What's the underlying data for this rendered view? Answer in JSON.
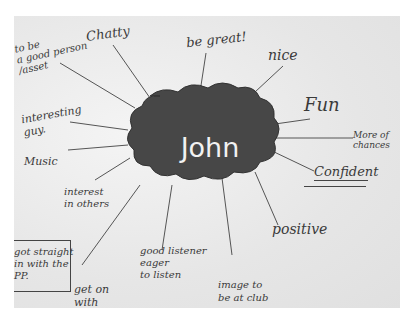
{
  "mind_map": {
    "center": "John",
    "branches": [
      {
        "id": "good-person",
        "text": "to be\na good person\n/asset"
      },
      {
        "id": "chatty",
        "text": "Chatty"
      },
      {
        "id": "be-great",
        "text": "be great!"
      },
      {
        "id": "nice",
        "text": "nice"
      },
      {
        "id": "fun",
        "text": "Fun"
      },
      {
        "id": "more-of-chances",
        "text": "More of\nchances"
      },
      {
        "id": "confident",
        "text": "Confident"
      },
      {
        "id": "positive",
        "text": "positive"
      },
      {
        "id": "image-club",
        "text": "image to\nbe at club"
      },
      {
        "id": "good-listener",
        "text": "good listener\neager\nto listen"
      },
      {
        "id": "get-on-with",
        "text": "get on\nwith"
      },
      {
        "id": "interest-others",
        "text": "interest\nin others"
      },
      {
        "id": "music",
        "text": "Music"
      },
      {
        "id": "interesting-guy",
        "text": "interesting\nguy."
      },
      {
        "id": "got-straight",
        "text": "got straight\nin with the\nPP."
      }
    ]
  },
  "colors": {
    "cloud": "#474747",
    "paper": "#ececec",
    "ink": "#3a3a3a"
  }
}
